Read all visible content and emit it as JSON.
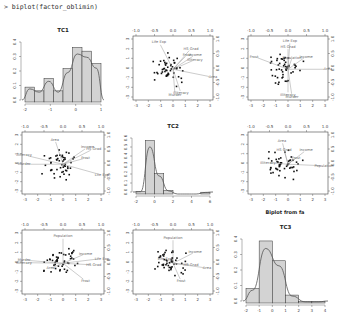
{
  "console": {
    "command": "> biplot(factor_oblimin)"
  },
  "overlay_title": "Biplot from fa",
  "colors": {
    "bar_fill": "#d3d3d3",
    "bar_stroke": "#333333",
    "curve": "#555555",
    "arrow": "#999999",
    "point": "#111111",
    "frame": "#444444"
  },
  "chart_data": [
    {
      "type": "bar",
      "panel": "row1-col1",
      "title": "TC1",
      "xticks": [
        -2,
        -1,
        0,
        1
      ],
      "yticks": [
        "0.0",
        "0.1",
        "0.2",
        "0.3",
        "0.4"
      ],
      "ylim": [
        0,
        0.5
      ],
      "bins": [
        -2.5,
        -2.0,
        -1.5,
        -1.0,
        -0.5,
        0.0,
        0.5,
        1.0,
        1.5
      ],
      "values": [
        0.12,
        0.09,
        0.19,
        0.09,
        0.27,
        0.44,
        0.41,
        0.31
      ],
      "density_curve": true
    },
    {
      "type": "scatter",
      "panel": "row1-col2",
      "subtype": "biplot",
      "x_factor": "TC2",
      "y_factor": "TC1",
      "xticks_bottom": [
        -3,
        -2,
        -1,
        0,
        1,
        2,
        3
      ],
      "xticks_top": [
        "-1.0",
        "-0.5",
        "0.0",
        "0.5",
        "1.0"
      ],
      "yticks_left": [
        -3,
        -2,
        -1,
        0,
        1,
        2,
        3
      ],
      "yticks_right": [
        "-1.0",
        "-0.5",
        "0.0",
        "0.5",
        "1.0"
      ],
      "vectors": [
        "Life Exp",
        "HS Grad",
        "Frost",
        "Income",
        "Illiteracy",
        "Area",
        "Murder",
        "Illiteracy"
      ]
    },
    {
      "type": "scatter",
      "panel": "row1-col3",
      "subtype": "biplot",
      "x_factor": "TC3",
      "y_factor": "TC1",
      "xticks_bottom": [
        -3,
        -2,
        -1,
        0,
        1,
        2,
        3
      ],
      "xticks_top": [
        "-1.0",
        "-0.5",
        "0.0",
        "0.5",
        "1.0"
      ],
      "yticks_left": [
        -3,
        -2,
        -1,
        0,
        1,
        2,
        3
      ],
      "yticks_right": [
        "-1.0",
        "-0.5",
        "0.0",
        "0.5",
        "1.0"
      ],
      "vectors": [
        "Life Exp",
        "HS Grad",
        "Frost",
        "Income",
        "Population",
        "Area",
        "Murder",
        "Illiteracy"
      ]
    },
    {
      "type": "scatter",
      "panel": "row2-col1",
      "subtype": "biplot",
      "x_factor": "TC1",
      "y_factor": "TC2",
      "xticks_bottom": [
        -3,
        -2,
        -1,
        0,
        1,
        2,
        3
      ],
      "xticks_top": [
        "-1.0",
        "-0.5",
        "0.0",
        "0.5",
        "1.0"
      ],
      "yticks_left": [
        -3,
        -2,
        -1,
        0,
        1,
        2,
        3
      ],
      "yticks_right": [
        "-1.0",
        "-0.5",
        "0.0",
        "0.5",
        "1.0"
      ],
      "vectors": [
        "Area",
        "Income",
        "HS Grad",
        "Frost",
        "Illiteracy",
        "Murder",
        "Life Exp"
      ]
    },
    {
      "type": "bar",
      "panel": "row2-col2",
      "title": "TC2",
      "xticks": [
        -2,
        0,
        2,
        4,
        6
      ],
      "yticks": [
        "0.0",
        "0.1",
        "0.2",
        "0.3",
        "0.4",
        "0.5",
        "0.6"
      ],
      "ylim": [
        0,
        0.65
      ],
      "bins": [
        -2,
        -1,
        0,
        1,
        2,
        3,
        4,
        5,
        6
      ],
      "values": [
        0.03,
        0.6,
        0.23,
        0.04,
        0.0,
        0.0,
        0.0,
        0.02
      ],
      "density_curve": true
    },
    {
      "type": "scatter",
      "panel": "row2-col3",
      "subtype": "biplot",
      "x_factor": "TC3",
      "y_factor": "TC2",
      "xticks_bottom": [
        -3,
        -2,
        -1,
        0,
        1,
        2,
        3
      ],
      "xticks_top": [
        "-1.0",
        "-0.5",
        "0.0",
        "0.5",
        "1.0"
      ],
      "yticks_left": [
        -3,
        -2,
        -1,
        0,
        1,
        2,
        3
      ],
      "yticks_right": [
        "-1.0",
        "-0.5",
        "0.0",
        "0.5",
        "1.0"
      ],
      "vectors": [
        "Area",
        "HS Grad",
        "Income",
        "Frost",
        "Illiteracy",
        "Population"
      ]
    },
    {
      "type": "scatter",
      "panel": "row3-col1",
      "subtype": "biplot",
      "x_factor": "TC1",
      "y_factor": "TC3",
      "xticks_bottom": [
        -3,
        -2,
        -1,
        0,
        1,
        2,
        3
      ],
      "xticks_top": [
        "-1.0",
        "-0.5",
        "0.0",
        "0.5",
        "1.0"
      ],
      "yticks_left": [
        -3,
        -2,
        -1,
        0,
        1,
        2,
        3
      ],
      "yticks_right": [
        "-1.0",
        "-0.5",
        "0.0",
        "0.5",
        "1.0"
      ],
      "vectors": [
        "Population",
        "Income",
        "Life Exp",
        "HS Grad",
        "Murder",
        "Illiteracy",
        "Area",
        "Frost"
      ]
    },
    {
      "type": "scatter",
      "panel": "row3-col2",
      "subtype": "biplot",
      "x_factor": "TC2",
      "y_factor": "TC3",
      "xticks_bottom": [
        -3,
        -2,
        -1,
        0,
        1,
        2,
        3
      ],
      "xticks_top": [
        "-1.0",
        "-0.5",
        "0.0",
        "0.5",
        "1.0"
      ],
      "yticks_left": [
        -3,
        -2,
        -1,
        0,
        1,
        2,
        3
      ],
      "yticks_right": [
        "-1.0",
        "-0.5",
        "0.0",
        "0.5",
        "1.0"
      ],
      "vectors": [
        "Population",
        "Income",
        "Life Exp",
        "HS Grad",
        "Area",
        "Frost"
      ]
    },
    {
      "type": "bar",
      "panel": "row3-col3",
      "title": "TC3",
      "xticks": [
        -2,
        -1,
        0,
        1,
        2,
        3,
        4
      ],
      "yticks": [
        "0.0",
        "0.1",
        "0.2",
        "0.3",
        "0.4"
      ],
      "ylim": [
        0,
        0.5
      ],
      "bins": [
        -2,
        -1,
        0,
        1,
        2,
        3,
        4
      ],
      "values": [
        0.11,
        0.47,
        0.32,
        0.06,
        0.01,
        0.01
      ],
      "density_curve": true
    }
  ]
}
